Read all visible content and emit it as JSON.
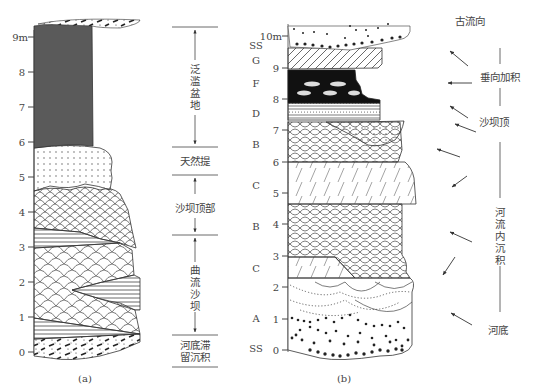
{
  "figure_a": {
    "caption": "(a)",
    "axis_ticks": [
      "0",
      "1",
      "2",
      "3",
      "4",
      "5",
      "6",
      "7",
      "8",
      "9m"
    ],
    "zones": [
      {
        "label": "泛滥盆地",
        "range_m": [
          6,
          9.1
        ]
      },
      {
        "label": "天然提",
        "range_m": [
          5.1,
          5.9
        ]
      },
      {
        "label": "沙坝顶部",
        "range_m": [
          3.3,
          4.9
        ]
      },
      {
        "label": "曲流沙坝",
        "range_m": [
          0.6,
          3.3
        ]
      },
      {
        "label_line1": "河底滞",
        "label_line2": "留沉积",
        "range_m": [
          -0.1,
          0.6
        ]
      }
    ],
    "zone_labels": {
      "floodplain": [
        "泛",
        "滥",
        "盆",
        "地"
      ],
      "levee": "天然提",
      "bar_top": "沙坝顶部",
      "point_bar": [
        "曲",
        "流",
        "沙",
        "坝"
      ],
      "lag_line1": "河底滞",
      "lag_line2": "留沉积"
    }
  },
  "figure_b": {
    "caption": "(b)",
    "axis_ticks": [
      "0",
      "1",
      "2",
      "3",
      "4",
      "5",
      "6",
      "7",
      "8",
      "9",
      "10m"
    ],
    "facies_letters": [
      "SS",
      "G",
      "F",
      "D",
      "B",
      "C",
      "B",
      "C",
      "A",
      "SS"
    ],
    "paleocurrent_header": "古流向",
    "interpretation": {
      "vertical_accretion": "垂向加积",
      "bar_top": "沙坝顶",
      "channel_fill": [
        "河",
        "流",
        "内",
        "沉",
        "积"
      ],
      "channel_base": "河底"
    }
  },
  "colors": {
    "line": "#333333",
    "floodplain_fill": "#5a5a5a",
    "coal_fill": "#111111",
    "paper": "#ffffff"
  }
}
